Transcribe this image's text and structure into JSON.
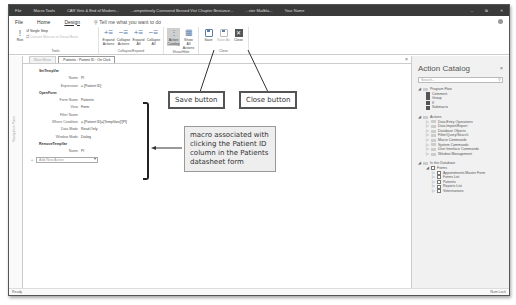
{
  "titlebar": {
    "items": [
      "File",
      "Macro Tools",
      "CAR Vets & End of Modern...",
      "...ompetitively Catresend Bessed Vist Chapter Bnstance...",
      "...ster Mailbla...",
      "Your Name"
    ],
    "controls": [
      "–",
      "⧉",
      "✕"
    ]
  },
  "menubar": {
    "tabs": [
      "File",
      "Home",
      "Design"
    ],
    "active_tab": "Design",
    "tell_me": "Tell me what you want to do"
  },
  "ribbon": {
    "tools": {
      "label": "Tools",
      "run": "Run",
      "single_step": "Single Step",
      "convert": "Convert Macros to Visual Basic"
    },
    "collapse_expand": {
      "label": "Collapse/Expand",
      "buttons": [
        "Expand Actions",
        "Collapse Actions",
        "Expand All",
        "Collapse All"
      ]
    },
    "show_hide": {
      "label": "Show/Hide",
      "buttons": [
        "Action Catalog",
        "Show All Actions"
      ]
    },
    "close": {
      "label": "Close",
      "save": "Save",
      "save_as": "Save As",
      "close": "Close"
    }
  },
  "nav_pane": {
    "label": "Navigation Pane"
  },
  "tabs": [
    {
      "label": "Main Menu",
      "active": false
    },
    {
      "label": "Patients : Patient ID : On Click",
      "active": true
    }
  ],
  "macro": {
    "actions": [
      {
        "name": "SetTempVar",
        "args": [
          {
            "label": "Name",
            "value": "PI"
          },
          {
            "label": "Expression",
            "value": "= [Patient ID]"
          }
        ]
      },
      {
        "name": "OpenForm",
        "args": [
          {
            "label": "Form Name",
            "value": "Patients"
          },
          {
            "label": "View",
            "value": "Form"
          },
          {
            "label": "Filter Name",
            "value": ""
          },
          {
            "label": "Where Condition",
            "value": "= [Patient ID]=[TempVars]![PI]"
          },
          {
            "label": "Data Mode",
            "value": "Read Only"
          },
          {
            "label": "Window Mode",
            "value": "Dialog"
          }
        ]
      },
      {
        "name": "RemoveTempVar",
        "args": [
          {
            "label": "Name",
            "value": "PI"
          }
        ]
      }
    ],
    "add_new_action": "Add New Action"
  },
  "catalog": {
    "title": "Action Catalog",
    "search_placeholder": "Search...",
    "program_flow": {
      "label": "Program Flow",
      "items": [
        "Comment",
        "Group",
        "If",
        "Submacro"
      ]
    },
    "actions": {
      "label": "Actions",
      "items": [
        "Data Entry Operations",
        "Data Import/Export",
        "Database Objects",
        "Filter/Query/Search",
        "Macro Commands",
        "System Commands",
        "User Interface Commands",
        "Window Management"
      ]
    },
    "in_database": {
      "label": "In this Database",
      "forms_label": "Forms",
      "forms": [
        "Appointments Master Form",
        "Forms List",
        "Patients",
        "Reports List",
        "Veterinarians"
      ]
    }
  },
  "statusbar": {
    "left": "Ready",
    "right": "Num Lock"
  },
  "callouts": {
    "save": "Save button",
    "close": "Close button",
    "macro": "macro associated with clicking the Patient ID column in the Patients datasheet form"
  }
}
